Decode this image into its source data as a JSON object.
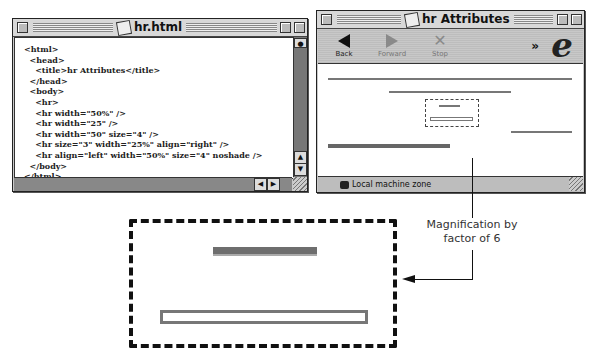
{
  "source_window": {
    "title": "hr.html",
    "code_lines": [
      "<html>",
      "  <head>",
      "    <title>hr Attributes</title>",
      "  </head>",
      "  <body>",
      "    <hr>",
      "    <hr width=\"50%\" />",
      "    <hr width=\"25\" />",
      "    <hr width=\"50\" size=\"4\" />",
      "    <hr size=\"3\" width=\"25%\" align=\"right\" />",
      "    <hr align=\"left\" width=\"50%\" size=\"4\" noshade />",
      "  </body>",
      "</html>"
    ]
  },
  "browser_window": {
    "title": "hr Attributes",
    "toolbar": {
      "back_label": "Back",
      "forward_label": "Forward",
      "stop_label": "Stop",
      "more_label": "»",
      "logo_glyph": "e"
    },
    "status": {
      "zone_label": "Local machine zone"
    }
  },
  "annotation": {
    "label_line1": "Magnification by",
    "label_line2": "factor of 6"
  }
}
